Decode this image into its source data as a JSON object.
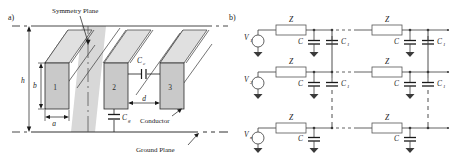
{
  "figure": {
    "panels": [
      {
        "tag": "a)",
        "name": "conductor-geometry",
        "labels": {
          "symmetry_plane": "Symmetry Plane",
          "conductor": "Conductor",
          "ground_plane": "Ground Plane",
          "coupling_cap": "C",
          "coupling_cap_sub": "c",
          "ground_cap": "C",
          "ground_cap_sub": "g",
          "dim_h": "h",
          "dim_b": "b",
          "dim_a": "a",
          "dim_d": "d"
        },
        "blocks": [
          "1",
          "2",
          "3"
        ],
        "colors": {
          "block_fill": "#c9c9c9",
          "plane_fill": "#d6d6d6",
          "line": "#1a1a1a"
        }
      },
      {
        "tag": "b)",
        "name": "ladder-network",
        "rows": [
          {
            "source": "V",
            "source_sub": "1",
            "impedance": "Z",
            "caps": [
              "C",
              "C"
            ],
            "cap_subs": [
              "",
              "1"
            ],
            "stages": 2
          },
          {
            "source": "V",
            "source_sub": "2",
            "impedance": "Z",
            "caps": [
              "C",
              "C"
            ],
            "cap_subs": [
              "",
              "1"
            ],
            "stages": 2
          },
          {
            "source": "V",
            "source_sub": "n",
            "impedance": "Z",
            "caps": [
              "C"
            ],
            "cap_subs": [
              ""
            ],
            "stages": 2
          }
        ],
        "colors": {
          "wire": "#3a3a3a",
          "box_fill": "#ffffff",
          "box_stroke": "#555555"
        }
      }
    ]
  }
}
